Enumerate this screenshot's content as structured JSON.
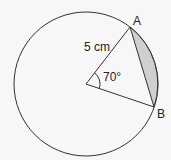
{
  "diagram": {
    "type": "circle-segment",
    "circle": {
      "cx": 86,
      "cy": 84,
      "r": 72
    },
    "points": {
      "A": {
        "label": "A",
        "x": 130,
        "y": 27
      },
      "B": {
        "label": "B",
        "x": 154,
        "y": 107
      },
      "O": {
        "x": 86,
        "y": 84
      }
    },
    "radius_label": "5 cm",
    "angle_label": "70°",
    "shaded_region": "minor segment AB",
    "colors": {
      "stroke": "#333333",
      "shade": "#cfcfcf",
      "background": "#f7f7f7"
    }
  }
}
